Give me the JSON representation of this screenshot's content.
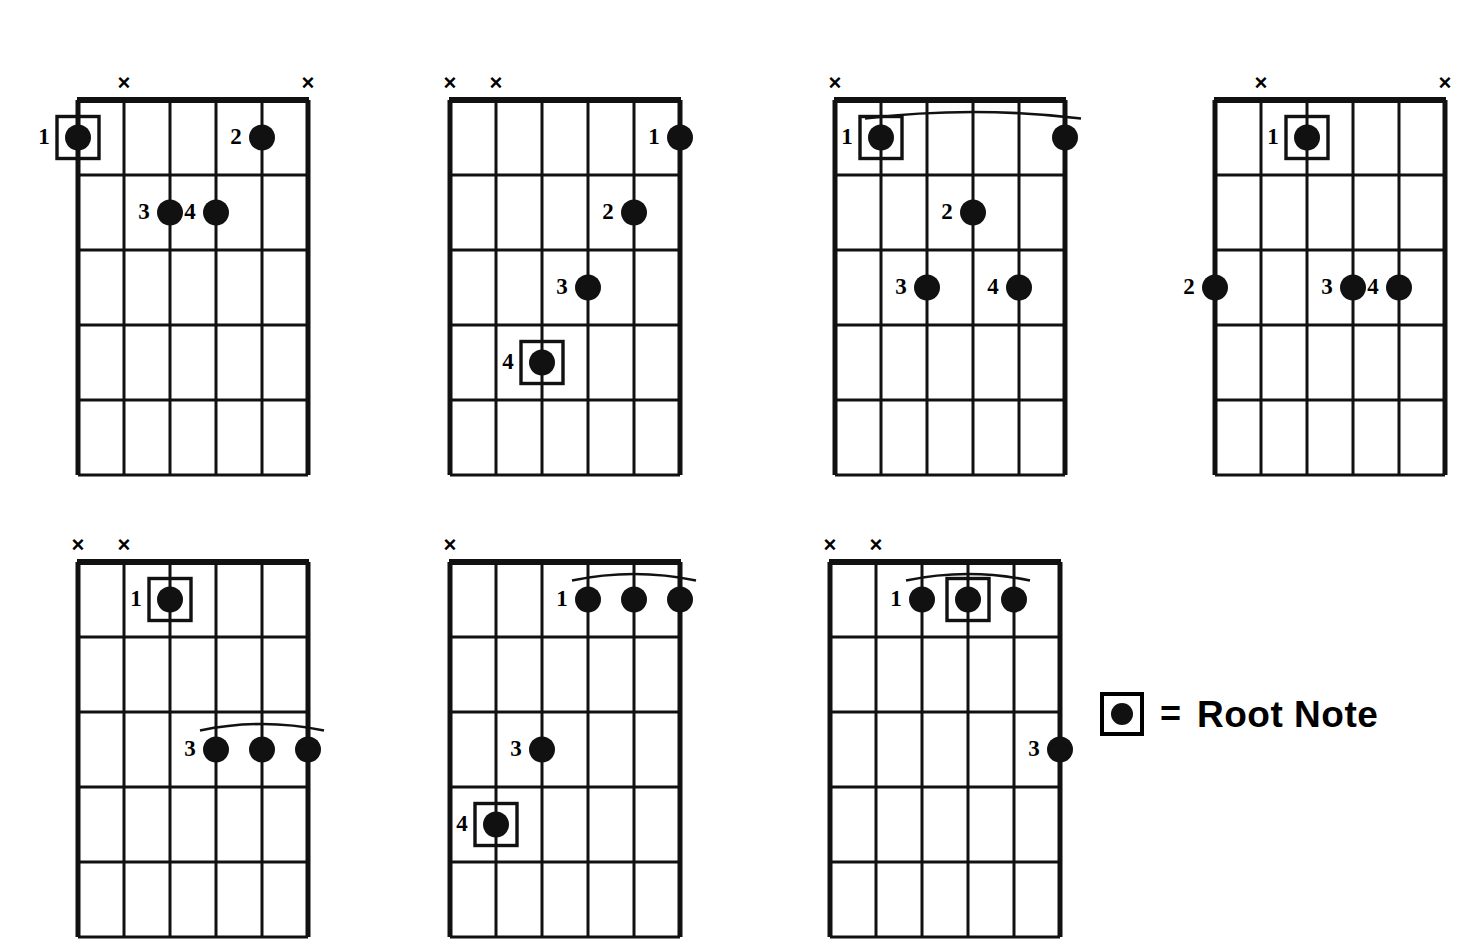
{
  "page": {
    "background_color": "#ffffff",
    "ink_color": "#000000",
    "diagram_count": 7,
    "strings": 6,
    "frets": 5
  },
  "legend": {
    "name": "root-note-legend",
    "equals_sign": "=",
    "label": "Root Note",
    "swatch_icon": "boxed-dot-icon"
  },
  "diagrams": [
    {
      "id": "chord-1",
      "position": {
        "left": 38,
        "top": 66
      },
      "muted_strings": [
        2,
        6
      ],
      "open_strings": [],
      "barres": [],
      "dots": [
        {
          "string": 1,
          "fret": 1,
          "finger": "1",
          "root": true,
          "label_side": "left"
        },
        {
          "string": 5,
          "fret": 1,
          "finger": "2",
          "root": false,
          "label_side": "left"
        },
        {
          "string": 3,
          "fret": 2,
          "finger": "3",
          "root": false,
          "label_side": "left"
        },
        {
          "string": 4,
          "fret": 2,
          "finger": "4",
          "root": false,
          "label_side": "left"
        }
      ]
    },
    {
      "id": "chord-2",
      "position": {
        "left": 410,
        "top": 66
      },
      "muted_strings": [
        1,
        2
      ],
      "open_strings": [],
      "barres": [],
      "dots": [
        {
          "string": 6,
          "fret": 1,
          "finger": "1",
          "root": false,
          "label_side": "left"
        },
        {
          "string": 5,
          "fret": 2,
          "finger": "2",
          "root": false,
          "label_side": "left"
        },
        {
          "string": 4,
          "fret": 3,
          "finger": "3",
          "root": false,
          "label_side": "left"
        },
        {
          "string": 3,
          "fret": 4,
          "finger": "4",
          "root": true,
          "label_side": "left"
        }
      ]
    },
    {
      "id": "chord-3",
      "position": {
        "left": 795,
        "top": 66
      },
      "muted_strings": [
        1
      ],
      "open_strings": [],
      "barres": [
        {
          "fret": 1,
          "from_string": 2,
          "to_string": 6
        }
      ],
      "dots": [
        {
          "string": 2,
          "fret": 1,
          "finger": "1",
          "root": true,
          "label_side": "left"
        },
        {
          "string": 6,
          "fret": 1,
          "finger": "",
          "root": false,
          "label_side": "none"
        },
        {
          "string": 4,
          "fret": 2,
          "finger": "2",
          "root": false,
          "label_side": "left"
        },
        {
          "string": 3,
          "fret": 3,
          "finger": "3",
          "root": false,
          "label_side": "left"
        },
        {
          "string": 5,
          "fret": 3,
          "finger": "4",
          "root": false,
          "label_side": "left"
        }
      ]
    },
    {
      "id": "chord-4",
      "position": {
        "left": 1175,
        "top": 66
      },
      "muted_strings": [
        2,
        6
      ],
      "open_strings": [],
      "barres": [],
      "dots": [
        {
          "string": 3,
          "fret": 1,
          "finger": "1",
          "root": true,
          "label_side": "left"
        },
        {
          "string": 1,
          "fret": 3,
          "finger": "2",
          "root": false,
          "label_side": "left"
        },
        {
          "string": 4,
          "fret": 3,
          "finger": "3",
          "root": false,
          "label_side": "left"
        },
        {
          "string": 5,
          "fret": 3,
          "finger": "4",
          "root": false,
          "label_side": "left"
        }
      ]
    },
    {
      "id": "chord-5",
      "position": {
        "left": 38,
        "top": 528
      },
      "muted_strings": [
        1,
        2
      ],
      "open_strings": [],
      "barres": [
        {
          "fret": 3,
          "from_string": 4,
          "to_string": 6
        }
      ],
      "dots": [
        {
          "string": 3,
          "fret": 1,
          "finger": "1",
          "root": true,
          "label_side": "left"
        },
        {
          "string": 4,
          "fret": 3,
          "finger": "3",
          "root": false,
          "label_side": "left"
        },
        {
          "string": 5,
          "fret": 3,
          "finger": "",
          "root": false,
          "label_side": "none"
        },
        {
          "string": 6,
          "fret": 3,
          "finger": "",
          "root": false,
          "label_side": "none"
        }
      ]
    },
    {
      "id": "chord-6",
      "position": {
        "left": 410,
        "top": 528
      },
      "muted_strings": [
        1
      ],
      "open_strings": [],
      "barres": [
        {
          "fret": 1,
          "from_string": 4,
          "to_string": 6
        }
      ],
      "dots": [
        {
          "string": 4,
          "fret": 1,
          "finger": "1",
          "root": false,
          "label_side": "left"
        },
        {
          "string": 5,
          "fret": 1,
          "finger": "",
          "root": false,
          "label_side": "none"
        },
        {
          "string": 6,
          "fret": 1,
          "finger": "",
          "root": false,
          "label_side": "none"
        },
        {
          "string": 3,
          "fret": 3,
          "finger": "3",
          "root": false,
          "label_side": "left"
        },
        {
          "string": 2,
          "fret": 4,
          "finger": "4",
          "root": true,
          "label_side": "left"
        }
      ]
    },
    {
      "id": "chord-7",
      "position": {
        "left": 790,
        "top": 528
      },
      "muted_strings": [
        1,
        2
      ],
      "open_strings": [],
      "barres": [
        {
          "fret": 1,
          "from_string": 3,
          "to_string": 5
        }
      ],
      "dots": [
        {
          "string": 3,
          "fret": 1,
          "finger": "1",
          "root": false,
          "label_side": "left"
        },
        {
          "string": 4,
          "fret": 1,
          "finger": "",
          "root": true,
          "label_side": "none"
        },
        {
          "string": 5,
          "fret": 1,
          "finger": "",
          "root": false,
          "label_side": "none"
        },
        {
          "string": 6,
          "fret": 3,
          "finger": "3",
          "root": false,
          "label_side": "left"
        }
      ]
    }
  ],
  "geometry": {
    "string_spacing": 46,
    "fret_spacing": 75,
    "dot_radius": 13,
    "root_box_size": 42,
    "mute_mark": "×"
  }
}
